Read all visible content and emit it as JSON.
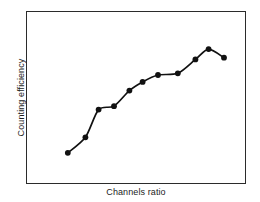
{
  "chart_data": {
    "type": "line",
    "title": "",
    "subtitle": "",
    "xlabel": "Channels ratio",
    "ylabel": "Counting efficiency",
    "x": [
      0.19,
      0.27,
      0.33,
      0.4,
      0.47,
      0.53,
      0.6,
      0.69,
      0.77,
      0.83,
      0.9
    ],
    "y": [
      0.18,
      0.27,
      0.43,
      0.45,
      0.54,
      0.59,
      0.63,
      0.64,
      0.72,
      0.78,
      0.73
    ],
    "series": [
      {
        "name": "quench curve",
        "values": [
          0.18,
          0.27,
          0.43,
          0.45,
          0.54,
          0.59,
          0.63,
          0.64,
          0.72,
          0.78,
          0.73
        ]
      }
    ],
    "xlim": [
      0,
      1
    ],
    "ylim": [
      0,
      1
    ],
    "xticks": [],
    "yticks": [],
    "xticklabels": [],
    "yticklabels": [],
    "grid": false,
    "legend": false,
    "legend_position": "none",
    "marker": "filled-circle",
    "marker_color": "#111111",
    "line_color": "#111111",
    "frame_color": "#2b2b2b",
    "background_color": "#ffffff",
    "annotations": []
  }
}
